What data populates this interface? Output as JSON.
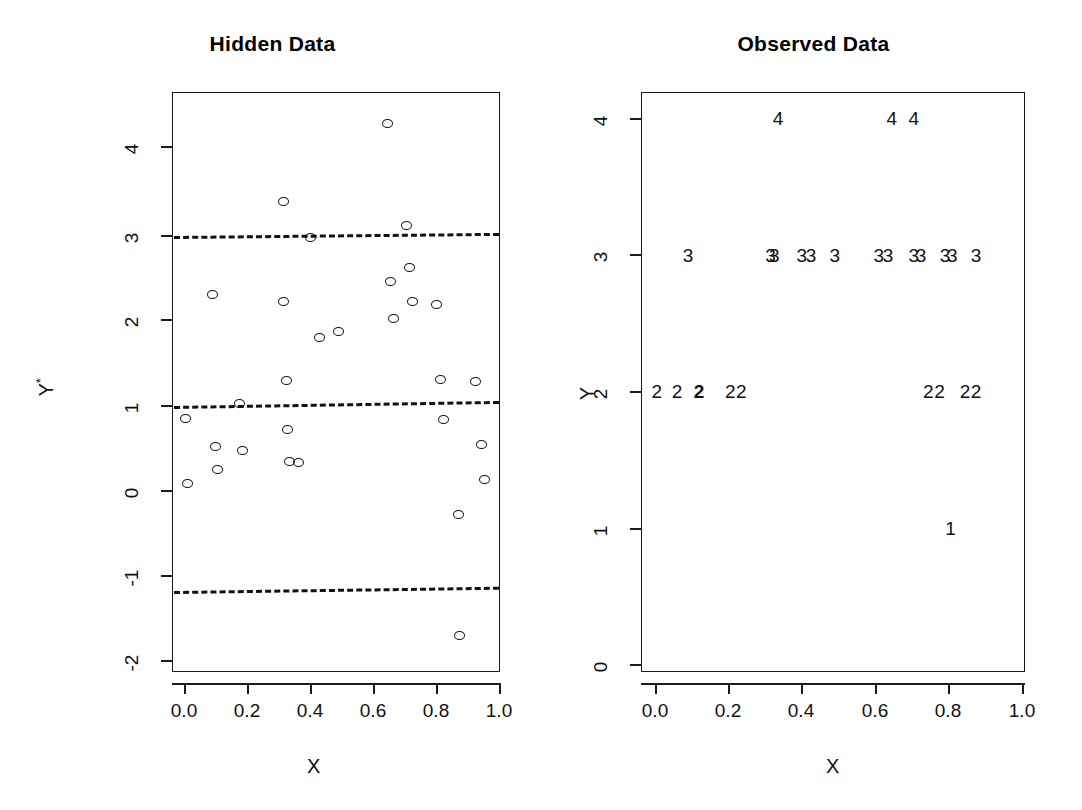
{
  "figure": {
    "background": "#ffffff",
    "ink_color": "#111111",
    "width": 1082,
    "height": 810
  },
  "panels": [
    {
      "id": "hidden",
      "title": "Hidden Data",
      "xlabel": "X",
      "ylabel": "Y*"
    },
    {
      "id": "observed",
      "title": "Observed Data",
      "xlabel": "X",
      "ylabel": "Y"
    }
  ],
  "chart_data": [
    {
      "type": "scatter",
      "title": "Hidden Data",
      "xlabel": "X",
      "ylabel": "Y*",
      "xlim": [
        -0.04,
        1.04
      ],
      "ylim": [
        -2.35,
        4.62
      ],
      "xticks": [
        "0.0",
        "0.2",
        "0.4",
        "0.6",
        "0.8",
        "1.0"
      ],
      "xtick_values": [
        0.0,
        0.2,
        0.4,
        0.6,
        0.8,
        1.0
      ],
      "yticks": [
        "4",
        "3",
        "2",
        "1",
        "0",
        "-1",
        "-2"
      ],
      "ytick_values": [
        4,
        3,
        2,
        1,
        0,
        -1,
        -2
      ],
      "grid": false,
      "legend": "none",
      "marker": "open-circle",
      "threshold_lines": [
        {
          "label": "cut3",
          "y_left": 3.0,
          "y_right": 3.05,
          "style": "dashed"
        },
        {
          "label": "cut2",
          "y_left": 1.0,
          "y_right": 1.06,
          "style": "dashed"
        },
        {
          "label": "cut1",
          "y_left": -1.0,
          "y_right": -0.95,
          "style": "dashed"
        }
      ],
      "points": [
        {
          "x": 0.005,
          "y": 0.82
        },
        {
          "x": 0.012,
          "y": 0.06
        },
        {
          "x": 0.09,
          "y": 2.27
        },
        {
          "x": 0.1,
          "y": 0.49
        },
        {
          "x": 0.105,
          "y": 0.22
        },
        {
          "x": 0.175,
          "y": 0.99
        },
        {
          "x": 0.185,
          "y": 0.44
        },
        {
          "x": 0.315,
          "y": 3.35
        },
        {
          "x": 0.315,
          "y": 2.18
        },
        {
          "x": 0.325,
          "y": 1.26
        },
        {
          "x": 0.33,
          "y": 0.69
        },
        {
          "x": 0.335,
          "y": 0.32
        },
        {
          "x": 0.365,
          "y": 0.3
        },
        {
          "x": 0.4,
          "y": 2.93
        },
        {
          "x": 0.43,
          "y": 1.76
        },
        {
          "x": 0.49,
          "y": 1.84
        },
        {
          "x": 0.645,
          "y": 4.26
        },
        {
          "x": 0.655,
          "y": 2.42
        },
        {
          "x": 0.665,
          "y": 1.99
        },
        {
          "x": 0.705,
          "y": 3.07
        },
        {
          "x": 0.715,
          "y": 2.58
        },
        {
          "x": 0.725,
          "y": 2.18
        },
        {
          "x": 0.8,
          "y": 2.15
        },
        {
          "x": 0.815,
          "y": 1.27
        },
        {
          "x": 0.825,
          "y": 0.81
        },
        {
          "x": 0.87,
          "y": -0.3
        },
        {
          "x": 0.875,
          "y": -1.71
        },
        {
          "x": 0.925,
          "y": 1.25
        },
        {
          "x": 0.945,
          "y": 0.52
        },
        {
          "x": 0.955,
          "y": 0.11
        }
      ]
    },
    {
      "type": "scatter",
      "title": "Observed Data",
      "xlabel": "X",
      "ylabel": "Y",
      "xlim": [
        -0.04,
        1.04
      ],
      "ylim": [
        -0.28,
        4.3
      ],
      "xticks": [
        "0.0",
        "0.2",
        "0.4",
        "0.6",
        "0.8",
        "1.0"
      ],
      "xtick_values": [
        0.0,
        0.2,
        0.4,
        0.6,
        0.8,
        1.0
      ],
      "yticks": [
        "4",
        "3",
        "2",
        "1",
        "0"
      ],
      "ytick_values": [
        4,
        3,
        2,
        1,
        0
      ],
      "grid": false,
      "legend": "none",
      "marker": "digit-label",
      "points": [
        {
          "x": 0.335,
          "y": 4,
          "label": "4"
        },
        {
          "x": 0.645,
          "y": 4,
          "label": "4"
        },
        {
          "x": 0.705,
          "y": 4,
          "label": "4"
        },
        {
          "x": 0.09,
          "y": 3,
          "label": "3"
        },
        {
          "x": 0.315,
          "y": 3,
          "label": "3"
        },
        {
          "x": 0.325,
          "y": 3,
          "label": "3"
        },
        {
          "x": 0.4,
          "y": 3,
          "label": "3"
        },
        {
          "x": 0.425,
          "y": 3,
          "label": "3"
        },
        {
          "x": 0.49,
          "y": 3,
          "label": "3"
        },
        {
          "x": 0.61,
          "y": 3,
          "label": "3"
        },
        {
          "x": 0.635,
          "y": 3,
          "label": "3"
        },
        {
          "x": 0.705,
          "y": 3,
          "label": "3"
        },
        {
          "x": 0.725,
          "y": 3,
          "label": "3"
        },
        {
          "x": 0.79,
          "y": 3,
          "label": "3"
        },
        {
          "x": 0.81,
          "y": 3,
          "label": "3"
        },
        {
          "x": 0.875,
          "y": 3,
          "label": "3"
        },
        {
          "x": 0.005,
          "y": 2,
          "label": "2"
        },
        {
          "x": 0.06,
          "y": 2,
          "label": "2"
        },
        {
          "x": 0.12,
          "y": 2,
          "label": "2",
          "bold": true
        },
        {
          "x": 0.205,
          "y": 2,
          "label": "2"
        },
        {
          "x": 0.235,
          "y": 2,
          "label": "2"
        },
        {
          "x": 0.745,
          "y": 2,
          "label": "2"
        },
        {
          "x": 0.775,
          "y": 2,
          "label": "2"
        },
        {
          "x": 0.845,
          "y": 2,
          "label": "2"
        },
        {
          "x": 0.875,
          "y": 2,
          "label": "2"
        },
        {
          "x": 0.805,
          "y": 1,
          "label": "1"
        }
      ]
    }
  ]
}
